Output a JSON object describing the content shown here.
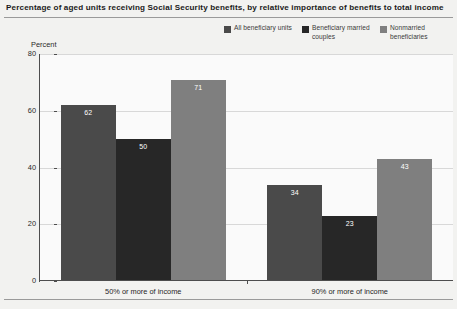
{
  "chart_data": {
    "type": "bar",
    "title": "Percentage of aged units receiving Social Security benefits, by relative importance of benefits to total income",
    "xlabel": "",
    "ylabel": "Percent",
    "ylim": [
      0,
      80
    ],
    "yticks": [
      0,
      20,
      40,
      60,
      80
    ],
    "ytick_labels": [
      "0",
      "20",
      "40",
      "60",
      "80"
    ],
    "grid": true,
    "legend_position": "top-right",
    "categories": [
      "50% or more of income",
      "90% or more of income"
    ],
    "series": [
      {
        "name": "All beneficiary units",
        "color": "#4a4a4a",
        "values": [
          62,
          34
        ],
        "labels": [
          "62",
          "34"
        ]
      },
      {
        "name": "Beneficiary married couples",
        "color": "#272727",
        "values": [
          50,
          23
        ],
        "labels": [
          "50",
          "23"
        ]
      },
      {
        "name": "Nonmarried beneficiaries",
        "color": "#7f7f7f",
        "values": [
          71,
          43
        ],
        "labels": [
          "71",
          "43"
        ]
      }
    ]
  },
  "legend": {
    "items": [
      {
        "label": "All beneficiary units",
        "color": "#4a4a4a"
      },
      {
        "label": "Beneficiary married couples",
        "color": "#272727"
      },
      {
        "label": "Nonmarried beneficiaries",
        "color": "#7f7f7f"
      }
    ]
  },
  "footer": {
    "note": ""
  }
}
